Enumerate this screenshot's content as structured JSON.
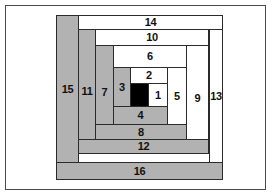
{
  "diagram": {
    "type": "log-cabin-block",
    "colors": {
      "light": "#ffffff",
      "dark": "#b2b2b2",
      "center": "#000000",
      "outline": "#2b2b2b",
      "frame": "#4a4a4a",
      "background": "#ffffff"
    },
    "frame": {
      "x": 5,
      "y": 5,
      "width": 261,
      "height": 185
    },
    "pieces": [
      {
        "label": "1",
        "shade": "light",
        "x": 148,
        "y": 83,
        "w": 20,
        "h": 24
      },
      {
        "label": "2",
        "shade": "light",
        "x": 130,
        "y": 67,
        "w": 38,
        "h": 17
      },
      {
        "label": "3",
        "shade": "gray",
        "x": 113,
        "y": 67,
        "w": 18,
        "h": 40
      },
      {
        "label": "4",
        "shade": "gray",
        "x": 113,
        "y": 106,
        "w": 55,
        "h": 19
      },
      {
        "label": "5",
        "shade": "light",
        "x": 167,
        "y": 67,
        "w": 20,
        "h": 58
      },
      {
        "label": "6",
        "shade": "light",
        "x": 113,
        "y": 45,
        "w": 74,
        "h": 23
      },
      {
        "label": "7",
        "shade": "gray",
        "x": 95,
        "y": 45,
        "w": 19,
        "h": 94
      },
      {
        "label": "8",
        "shade": "gray",
        "x": 95,
        "y": 124,
        "w": 92,
        "h": 16
      },
      {
        "label": "9",
        "shade": "light",
        "x": 186,
        "y": 45,
        "w": 23,
        "h": 107
      },
      {
        "label": "10",
        "shade": "light",
        "x": 95,
        "y": 29,
        "w": 114,
        "h": 17
      },
      {
        "label": "11",
        "shade": "gray",
        "x": 78,
        "y": 29,
        "w": 18,
        "h": 124
      },
      {
        "label": "12",
        "shade": "gray",
        "x": 78,
        "y": 139,
        "w": 131,
        "h": 15
      },
      {
        "label": "13",
        "shade": "light",
        "x": 209,
        "y": 29,
        "w": 14,
        "h": 134
      },
      {
        "label": "14",
        "shade": "light",
        "x": 78,
        "y": 15,
        "w": 145,
        "h": 15
      },
      {
        "label": "15",
        "shade": "gray",
        "x": 56,
        "y": 15,
        "w": 23,
        "h": 148
      },
      {
        "label": "16",
        "shade": "gray",
        "x": 56,
        "y": 162,
        "w": 167,
        "h": 18
      },
      {
        "label": "",
        "shade": "black",
        "x": 130,
        "y": 83,
        "w": 19,
        "h": 24
      }
    ]
  }
}
